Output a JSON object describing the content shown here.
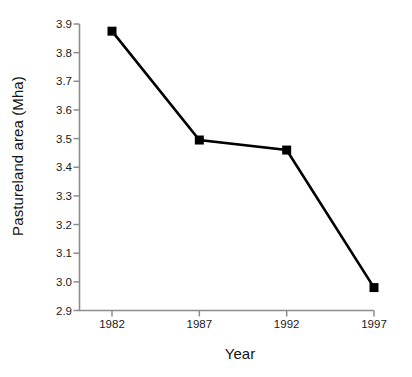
{
  "chart_data": {
    "type": "line",
    "title": "",
    "subtitle": "",
    "xlabel": "Year",
    "ylabel": "Pastureland area (Mha)",
    "x": [
      1982,
      1987,
      1992,
      1997
    ],
    "categories": [
      "1982",
      "1987",
      "1992",
      "1997"
    ],
    "values": [
      3.875,
      3.495,
      3.46,
      2.98
    ],
    "series": [
      {
        "name": "Pastureland area",
        "values": [
          3.875,
          3.495,
          3.46,
          2.98
        ]
      }
    ],
    "xlim": [
      1980.5,
      1997
    ],
    "ylim": [
      2.9,
      3.9
    ],
    "ytick_labels": [
      "3.9",
      "3.8",
      "3.7",
      "3.6",
      "3.5",
      "3.4",
      "3.3",
      "3.2",
      "3.1",
      "3.0",
      "2.9"
    ],
    "ytick_values": [
      3.9,
      3.8,
      3.7,
      3.6,
      3.5,
      3.4,
      3.3,
      3.2,
      3.1,
      3.0,
      2.9
    ],
    "xtick_labels": [
      "1982",
      "1987",
      "1992",
      "1997"
    ],
    "xtick_values": [
      1982,
      1987,
      1992,
      1997
    ],
    "grid": false,
    "legend": false,
    "legend_position": "none",
    "marker": "filled-square",
    "line_color": "#000000",
    "marker_color": "#000000",
    "axis_color": "#8c8c8c",
    "background_color": "#ffffff",
    "annotations": []
  },
  "axes": {
    "y_title": "Pastureland area (Mha)",
    "x_title": "Year"
  }
}
